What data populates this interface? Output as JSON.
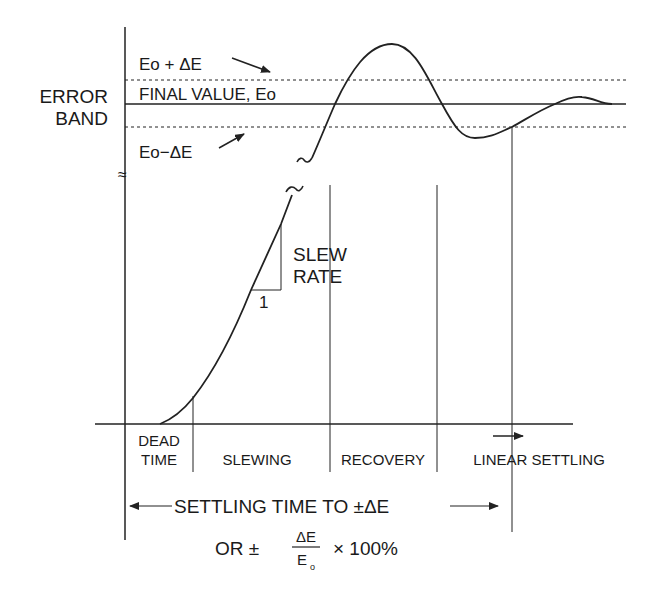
{
  "diagram": {
    "y_axis_label": [
      "ERROR",
      "BAND"
    ],
    "levels": {
      "upper_band": "Eo + ΔE",
      "final_value": "FINAL VALUE, Eo",
      "lower_band": "Eo−ΔE"
    },
    "slew": {
      "label_line1": "SLEW",
      "label_line2": "RATE",
      "run_label": "1"
    },
    "phases": {
      "dead_time_line1": "DEAD",
      "dead_time_line2": "TIME",
      "slewing": "SLEWING",
      "recovery": "RECOVERY",
      "linear_settling": "LINEAR SETTLING"
    },
    "settling_time": {
      "label": "SETTLING TIME TO ±ΔE",
      "or_prefix": "OR ±",
      "fraction_numerator": "ΔE",
      "fraction_denominator": "E",
      "fraction_denominator_sub": "o",
      "multiplier": "× 100%"
    },
    "axis_break_symbol": "≈"
  }
}
